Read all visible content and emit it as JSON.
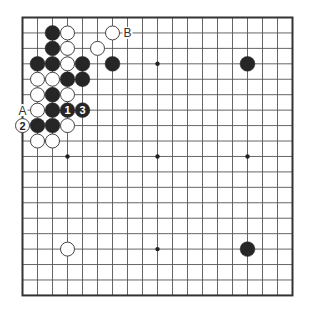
{
  "board": {
    "size": 19,
    "origin_x": 22.5,
    "origin_y": 17.5,
    "spacing_x": 15.0,
    "spacing_y": 15.44,
    "stone_radius": 7.4,
    "colors": {
      "line": "#555555",
      "border": "#333333",
      "black_stone": "#262626",
      "white_stone_fill": "#ffffff",
      "white_stone_edge": "#444444",
      "label_on_black": "#ffffff",
      "label_on_white": "#222222",
      "label_empty": "#333333"
    },
    "star_points": [
      [
        3,
        3
      ],
      [
        9,
        3
      ],
      [
        15,
        3
      ],
      [
        3,
        9
      ],
      [
        9,
        9
      ],
      [
        15,
        9
      ],
      [
        3,
        15
      ],
      [
        9,
        15
      ],
      [
        15,
        15
      ]
    ],
    "stones": [
      {
        "col": 2,
        "row": 1,
        "color": "black"
      },
      {
        "col": 3,
        "row": 1,
        "color": "white"
      },
      {
        "col": 6,
        "row": 1,
        "color": "white"
      },
      {
        "col": 2,
        "row": 2,
        "color": "black"
      },
      {
        "col": 3,
        "row": 2,
        "color": "white"
      },
      {
        "col": 5,
        "row": 2,
        "color": "white"
      },
      {
        "col": 1,
        "row": 3,
        "color": "black"
      },
      {
        "col": 2,
        "row": 3,
        "color": "black"
      },
      {
        "col": 3,
        "row": 3,
        "color": "white"
      },
      {
        "col": 4,
        "row": 3,
        "color": "black"
      },
      {
        "col": 6,
        "row": 3,
        "color": "black"
      },
      {
        "col": 15,
        "row": 3,
        "color": "black"
      },
      {
        "col": 1,
        "row": 4,
        "color": "white"
      },
      {
        "col": 2,
        "row": 4,
        "color": "white"
      },
      {
        "col": 3,
        "row": 4,
        "color": "black"
      },
      {
        "col": 4,
        "row": 4,
        "color": "black"
      },
      {
        "col": 1,
        "row": 5,
        "color": "white"
      },
      {
        "col": 2,
        "row": 5,
        "color": "black"
      },
      {
        "col": 3,
        "row": 5,
        "color": "white"
      },
      {
        "col": 1,
        "row": 6,
        "color": "white"
      },
      {
        "col": 2,
        "row": 6,
        "color": "black"
      },
      {
        "col": 3,
        "row": 6,
        "color": "black",
        "label": "1"
      },
      {
        "col": 4,
        "row": 6,
        "color": "black",
        "label": "3"
      },
      {
        "col": 0,
        "row": 7,
        "color": "white",
        "label": "2"
      },
      {
        "col": 1,
        "row": 7,
        "color": "black"
      },
      {
        "col": 2,
        "row": 7,
        "color": "black"
      },
      {
        "col": 3,
        "row": 7,
        "color": "white"
      },
      {
        "col": 1,
        "row": 8,
        "color": "white"
      },
      {
        "col": 2,
        "row": 8,
        "color": "white"
      },
      {
        "col": 3,
        "row": 15,
        "color": "white"
      },
      {
        "col": 15,
        "row": 15,
        "color": "black"
      }
    ],
    "point_labels": [
      {
        "col": 0,
        "row": 6,
        "text": "A"
      },
      {
        "col": 7,
        "row": 1,
        "text": "B"
      }
    ]
  }
}
